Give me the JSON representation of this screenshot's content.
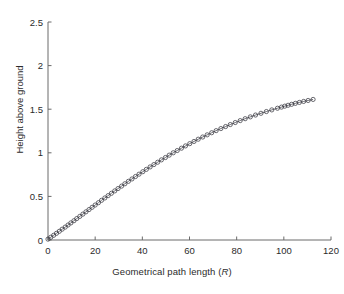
{
  "chart_data": {
    "type": "scatter",
    "title": "",
    "subtitle": "",
    "xlabel_prefix": "Geometrical path length (",
    "xlabel_italic": "R",
    "xlabel_suffix": ")",
    "xlabel": "Geometrical path length (R)",
    "ylabel": "Height above ground",
    "xlim": [
      0,
      120
    ],
    "ylim": [
      0,
      2.5
    ],
    "xticks": [
      0,
      20,
      40,
      60,
      80,
      100,
      120
    ],
    "xticklabels": [
      "0",
      "20",
      "40",
      "60",
      "80",
      "100",
      "120"
    ],
    "yticks": [
      0,
      0.5,
      1,
      1.5,
      2,
      2.5
    ],
    "yticklabels": [
      "0",
      "0.5",
      "1",
      "1.5",
      "2",
      "2.5"
    ],
    "grid": false,
    "legend": null,
    "marker": "open-circle",
    "marker_color": "#3a3a42",
    "line_color": "#4a4a52",
    "series": [
      {
        "name": "height vs geometrical path length",
        "x": [
          0.0,
          1.2,
          2.4,
          3.6,
          4.8,
          6.0,
          7.3,
          8.5,
          9.7,
          11.0,
          12.2,
          13.5,
          14.8,
          16.1,
          17.4,
          18.7,
          20.0,
          21.4,
          22.7,
          24.1,
          25.5,
          26.9,
          28.3,
          29.7,
          31.2,
          32.6,
          34.1,
          35.6,
          37.1,
          38.6,
          40.2,
          41.7,
          43.3,
          44.9,
          46.5,
          48.1,
          49.8,
          51.4,
          53.1,
          54.8,
          56.6,
          58.3,
          60.1,
          61.9,
          63.7,
          65.6,
          67.5,
          69.4,
          71.3,
          73.3,
          75.3,
          77.3,
          79.4,
          81.5,
          83.6,
          85.8,
          88.0,
          90.3,
          92.6,
          94.9,
          97.3,
          99.0,
          100.4,
          101.8,
          103.3,
          104.9,
          106.6,
          108.4,
          110.3,
          112.4
        ],
        "y": [
          0.01,
          0.032,
          0.054,
          0.077,
          0.1,
          0.124,
          0.148,
          0.172,
          0.196,
          0.221,
          0.246,
          0.271,
          0.297,
          0.323,
          0.349,
          0.375,
          0.401,
          0.428,
          0.455,
          0.482,
          0.509,
          0.536,
          0.563,
          0.59,
          0.618,
          0.645,
          0.673,
          0.7,
          0.728,
          0.755,
          0.783,
          0.81,
          0.838,
          0.865,
          0.892,
          0.919,
          0.946,
          0.973,
          1.0,
          1.026,
          1.053,
          1.079,
          1.105,
          1.13,
          1.156,
          1.181,
          1.206,
          1.23,
          1.254,
          1.278,
          1.301,
          1.324,
          1.347,
          1.369,
          1.391,
          1.412,
          1.433,
          1.453,
          1.473,
          1.492,
          1.511,
          1.524,
          1.535,
          1.545,
          1.556,
          1.567,
          1.578,
          1.589,
          1.6,
          1.612
        ]
      }
    ]
  }
}
